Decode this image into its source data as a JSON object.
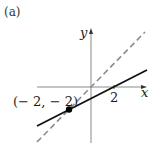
{
  "figure": {
    "panel_label": "(a)",
    "axes": {
      "x_label": "x",
      "y_label": "y",
      "x_tick": "2"
    },
    "point": {
      "label": "(− 2, − 2)",
      "x": -2,
      "y": -2
    },
    "lines": [
      {
        "name": "solid line",
        "style": "solid",
        "color": "#111111",
        "slope": 0.5,
        "intercept": -1
      },
      {
        "name": "dashed line y=x",
        "style": "dashed",
        "color": "#888888",
        "slope": 1,
        "intercept": 0
      }
    ]
  }
}
